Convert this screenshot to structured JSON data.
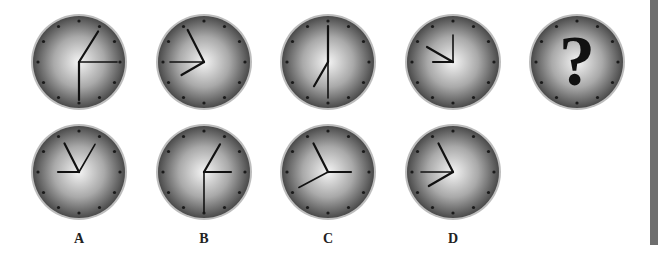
{
  "puzzle": {
    "type": "clock-sequence",
    "sequence": [
      {
        "id": "clock-1",
        "cx": 79,
        "cy": 62,
        "hands": [
          {
            "angle": 32,
            "len": 36,
            "w": 2.2
          },
          {
            "angle": 90,
            "len": 38,
            "w": 1.6
          },
          {
            "angle": 180,
            "len": 38,
            "w": 2.2
          }
        ]
      },
      {
        "id": "clock-2",
        "cx": 204,
        "cy": 62,
        "hands": [
          {
            "angle": 333,
            "len": 36,
            "w": 2.2
          },
          {
            "angle": 270,
            "len": 34,
            "w": 1.6
          },
          {
            "angle": 240,
            "len": 26,
            "w": 2.2
          }
        ]
      },
      {
        "id": "clock-3",
        "cx": 328,
        "cy": 62,
        "hands": [
          {
            "angle": 0,
            "len": 36,
            "w": 2.2
          },
          {
            "angle": 180,
            "len": 36,
            "w": 1.6
          },
          {
            "angle": 210,
            "len": 28,
            "w": 2.2
          }
        ]
      },
      {
        "id": "clock-4",
        "cx": 453,
        "cy": 62,
        "hands": [
          {
            "angle": 0,
            "len": 27,
            "w": 1.6
          },
          {
            "angle": 300,
            "len": 30,
            "w": 2.2
          },
          {
            "angle": 270,
            "len": 20,
            "w": 2.2
          }
        ]
      }
    ],
    "question_clock": {
      "id": "clock-5",
      "cx": 577,
      "cy": 62,
      "symbol": "?"
    },
    "options": [
      {
        "label": "A",
        "cx": 79,
        "cy": 172,
        "hands": [
          {
            "angle": 333,
            "len": 32,
            "w": 2.2
          },
          {
            "angle": 30,
            "len": 32,
            "w": 1.6
          },
          {
            "angle": 270,
            "len": 21,
            "w": 2.2
          }
        ]
      },
      {
        "label": "B",
        "cx": 204,
        "cy": 172,
        "hands": [
          {
            "angle": 30,
            "len": 32,
            "w": 2.2
          },
          {
            "angle": 90,
            "len": 27,
            "w": 2.2
          },
          {
            "angle": 180,
            "len": 40,
            "w": 1.6
          }
        ]
      },
      {
        "label": "C",
        "cx": 328,
        "cy": 172,
        "hands": [
          {
            "angle": 333,
            "len": 32,
            "w": 2.2
          },
          {
            "angle": 90,
            "len": 23,
            "w": 2.2
          },
          {
            "angle": 242,
            "len": 33,
            "w": 1.6
          }
        ]
      },
      {
        "label": "D",
        "cx": 453,
        "cy": 172,
        "hands": [
          {
            "angle": 333,
            "len": 32,
            "w": 2.2
          },
          {
            "angle": 270,
            "len": 32,
            "w": 1.6
          },
          {
            "angle": 240,
            "len": 28,
            "w": 2.2
          }
        ]
      }
    ]
  },
  "labels": {
    "A": "A",
    "B": "B",
    "C": "C",
    "D": "D"
  },
  "colors": {
    "face_center": "#f4f4f4",
    "face_edge": "#4a4a4a",
    "hand": "#111111",
    "tick": "#1a1a1a",
    "sidebar": "#6e6e6e"
  }
}
